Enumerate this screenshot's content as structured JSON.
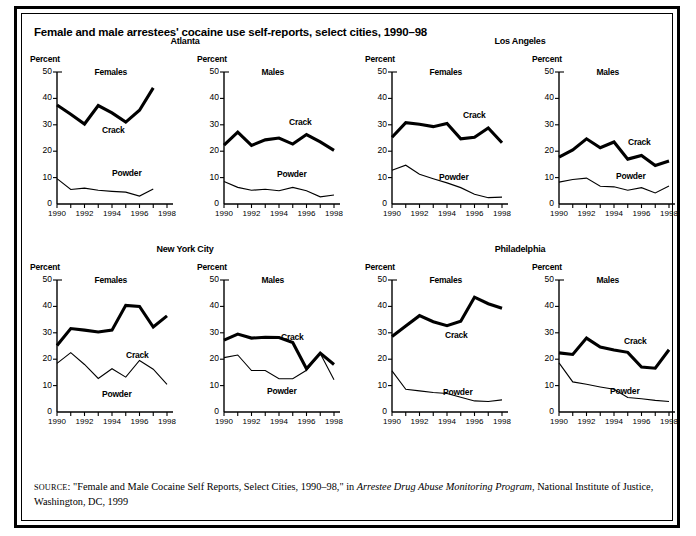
{
  "title": "Female and male arrestees' cocaine use self-reports, select cities, 1990–98",
  "source": {
    "prefix": "SOURCE",
    "text_before_italic": ": \"Female and Male Cocaine Self Reports, Select Cities, 1990–98,\" in ",
    "italic": "Arrestee Drug Abuse Monitoring Program",
    "text_after_italic": ", National Institute of Justice, Washington, DC, 1999"
  },
  "axis": {
    "ylabel": "Percent",
    "yticks": [
      "0",
      "10",
      "20",
      "30",
      "40",
      "50"
    ],
    "ytick_values": [
      0,
      10,
      20,
      30,
      40,
      50
    ],
    "xticks_shown": [
      "1990",
      "1992",
      "1994",
      "1996",
      "1998"
    ],
    "xtick_values_shown": [
      1990,
      1992,
      1994,
      1996,
      1998
    ],
    "xticks_all": [
      1990,
      1991,
      1992,
      1993,
      1994,
      1995,
      1996,
      1997,
      1998
    ],
    "ylim": [
      0,
      50
    ],
    "xlim": [
      1990,
      1998
    ]
  },
  "series_labels": {
    "crack": "Crack",
    "powder": "Powder"
  },
  "sex_labels": {
    "female": "Females",
    "male": "Males"
  },
  "cities": [
    "Atlanta",
    "Los Angeles",
    "New York City",
    "Philadelphia"
  ],
  "colors": {
    "line": "#000000",
    "background": "#ffffff",
    "border": "#000000"
  },
  "chart_data": {
    "type": "line",
    "title": "Female and male arrestees' cocaine use self-reports, select cities, 1990–98",
    "xlabel": "",
    "ylabel": "Percent",
    "ylim": [
      0,
      50
    ],
    "xlim": [
      1990,
      1998
    ],
    "grid": false,
    "legend": "inline-annotations",
    "panels": [
      {
        "city": "Atlanta",
        "sex": "Females",
        "x": [
          1990,
          1991,
          1992,
          1993,
          1994,
          1995,
          1996,
          1997
        ],
        "series": [
          {
            "name": "Crack",
            "values": [
              37.5,
              34.0,
              30.3,
              37.3,
              34.5,
              31.0,
              35.5,
              44.0
            ]
          },
          {
            "name": "Powder",
            "values": [
              9.6,
              5.5,
              6.0,
              5.2,
              4.8,
              4.5,
              3.0,
              5.7
            ]
          }
        ]
      },
      {
        "city": "Atlanta",
        "sex": "Males",
        "x": [
          1990,
          1991,
          1992,
          1993,
          1994,
          1995,
          1996,
          1997,
          1998
        ],
        "series": [
          {
            "name": "Crack",
            "values": [
              22.3,
              27.2,
              22.2,
              24.3,
              25.0,
              22.7,
              26.3,
              23.5,
              20.3
            ]
          },
          {
            "name": "Powder",
            "values": [
              8.5,
              6.3,
              5.2,
              5.6,
              5.0,
              6.3,
              5.0,
              2.7,
              3.4
            ]
          }
        ]
      },
      {
        "city": "Los Angeles",
        "sex": "Females",
        "x": [
          1990,
          1991,
          1992,
          1993,
          1994,
          1995,
          1996,
          1997,
          1998
        ],
        "series": [
          {
            "name": "Crack",
            "values": [
              25.3,
              30.8,
              30.2,
              29.3,
              30.5,
              24.7,
              25.3,
              28.8,
              23.2
            ]
          },
          {
            "name": "Powder",
            "values": [
              12.8,
              14.7,
              11.3,
              9.6,
              8.0,
              6.2,
              3.7,
              2.4,
              2.6
            ]
          }
        ]
      },
      {
        "city": "Los Angeles",
        "sex": "Males",
        "x": [
          1990,
          1991,
          1992,
          1993,
          1994,
          1995,
          1996,
          1997,
          1998
        ],
        "series": [
          {
            "name": "Crack",
            "values": [
              17.8,
              20.5,
              24.7,
              21.3,
              23.5,
              17.0,
              18.4,
              14.6,
              16.3
            ]
          },
          {
            "name": "Powder",
            "values": [
              8.3,
              9.3,
              9.8,
              6.7,
              6.5,
              5.2,
              6.2,
              4.2,
              6.8
            ]
          }
        ]
      },
      {
        "city": "New York City",
        "sex": "Females",
        "x": [
          1990,
          1991,
          1992,
          1993,
          1994,
          1995,
          1996,
          1997,
          1998
        ],
        "series": [
          {
            "name": "Crack",
            "values": [
              25.2,
              31.6,
              31.0,
              30.3,
              31.0,
              40.4,
              40.0,
              32.2,
              36.4
            ]
          },
          {
            "name": "Powder",
            "values": [
              18.4,
              22.5,
              18.0,
              12.7,
              16.4,
              13.2,
              19.5,
              16.2,
              10.5
            ]
          }
        ]
      },
      {
        "city": "New York City",
        "sex": "Males",
        "x": [
          1990,
          1991,
          1992,
          1993,
          1994,
          1995,
          1996,
          1997,
          1998
        ],
        "series": [
          {
            "name": "Crack",
            "values": [
              27.2,
              29.5,
              28.0,
              28.3,
              28.2,
              26.3,
              16.4,
              22.3,
              18.0
            ]
          },
          {
            "name": "Powder",
            "values": [
              20.6,
              21.6,
              15.7,
              15.7,
              12.6,
              12.6,
              15.8,
              22.2,
              12.2
            ]
          }
        ]
      },
      {
        "city": "Philadelphia",
        "sex": "Females",
        "x": [
          1990,
          1991,
          1992,
          1993,
          1994,
          1995,
          1996,
          1997,
          1998
        ],
        "series": [
          {
            "name": "Crack",
            "values": [
              28.6,
              32.6,
              36.5,
              34.2,
              32.7,
              34.4,
              43.5,
              41.0,
              39.3
            ]
          },
          {
            "name": "Powder",
            "values": [
              15.6,
              8.6,
              8.0,
              7.4,
              7.0,
              5.6,
              4.2,
              4.0,
              4.6
            ]
          }
        ]
      },
      {
        "city": "Philadelphia",
        "sex": "Males",
        "x": [
          1990,
          1991,
          1992,
          1993,
          1994,
          1995,
          1996,
          1997,
          1998
        ],
        "series": [
          {
            "name": "Crack",
            "values": [
              22.4,
              21.8,
              28.0,
              24.6,
              23.5,
              22.6,
              17.0,
              16.6,
              23.6
            ]
          },
          {
            "name": "Powder",
            "values": [
              18.6,
              11.4,
              10.5,
              9.5,
              8.6,
              5.5,
              5.0,
              4.4,
              4.0
            ]
          }
        ]
      }
    ]
  },
  "annotation_positions": [
    {
      "crack": {
        "left": 72,
        "top": 71
      },
      "powder": {
        "left": 82,
        "top": 114
      }
    },
    {
      "crack": {
        "left": 92,
        "top": 63
      },
      "powder": {
        "left": 80,
        "top": 115
      }
    },
    {
      "crack": {
        "left": 98,
        "top": 56
      },
      "powder": {
        "left": 74,
        "top": 118
      }
    },
    {
      "crack": {
        "left": 96,
        "top": 83
      },
      "powder": {
        "left": 84,
        "top": 117
      }
    },
    {
      "crack": {
        "left": 96,
        "top": 88
      },
      "powder": {
        "left": 72,
        "top": 127
      }
    },
    {
      "crack": {
        "left": 84,
        "top": 70
      },
      "powder": {
        "left": 70,
        "top": 124
      }
    },
    {
      "crack": {
        "left": 80,
        "top": 68
      },
      "powder": {
        "left": 78,
        "top": 125
      }
    },
    {
      "crack": {
        "left": 92,
        "top": 74
      },
      "powder": {
        "left": 78,
        "top": 124
      }
    }
  ]
}
